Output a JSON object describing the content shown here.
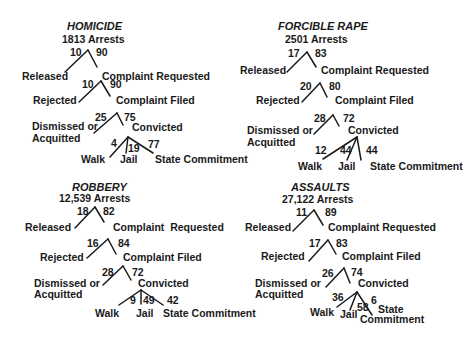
{
  "diagrams": [
    {
      "title": "HOMICIDE",
      "arrests": "1813 Arrests",
      "stage1": {
        "left_pct": "10",
        "right_pct": "90",
        "left_label": "Released",
        "right_label": "Complaint Requested"
      },
      "stage2": {
        "left_pct": "10",
        "right_pct": "90",
        "left_label": "Rejected",
        "right_label": "Complaint Filed"
      },
      "stage3": {
        "left_pct": "25",
        "right_pct": "75",
        "left_label_1": "Dismissed or",
        "left_label_2": "Acquitted",
        "right_label": "Convicted"
      },
      "outcomes": {
        "walk_pct": "4",
        "jail_pct": "19",
        "state_pct": "77",
        "walk_label": "Walk",
        "jail_label": "Jail",
        "state_label_1": "State Commitment",
        "state_label_2": ""
      }
    },
    {
      "title": "FORCIBLE RAPE",
      "arrests": "2501 Arrests",
      "stage1": {
        "left_pct": "17",
        "right_pct": "83",
        "left_label": "Released",
        "right_label": "Complaint Requested"
      },
      "stage2": {
        "left_pct": "20",
        "right_pct": "80",
        "left_label": "Rejected",
        "right_label": "Complaint Filed"
      },
      "stage3": {
        "left_pct": "28",
        "right_pct": "72",
        "left_label_1": "Dismissed or",
        "left_label_2": "Acquitted",
        "right_label": "Convicted"
      },
      "outcomes": {
        "walk_pct": "12",
        "jail_pct": "44",
        "state_pct": "44",
        "walk_label": "Walk",
        "jail_label": "Jail",
        "state_label_1": "State Commitment",
        "state_label_2": ""
      }
    },
    {
      "title": "ROBBERY",
      "arrests": "12,539 Arrests",
      "stage1": {
        "left_pct": "18",
        "right_pct": "82",
        "left_label": "Released",
        "right_label": "Complaint  Requested"
      },
      "stage2": {
        "left_pct": "16",
        "right_pct": "84",
        "left_label": "Rejected",
        "right_label": "Complaint Filed"
      },
      "stage3": {
        "left_pct": "28",
        "right_pct": "72",
        "left_label_1": "Dismissed or",
        "left_label_2": "Acquitted",
        "right_label": "Convicted"
      },
      "outcomes": {
        "walk_pct": "9",
        "jail_pct": "49",
        "state_pct": "42",
        "walk_label": "Walk",
        "jail_label": "Jail",
        "state_label_1": "State Commitment",
        "state_label_2": ""
      }
    },
    {
      "title": "ASSAULTS",
      "arrests": "27,122 Arrests",
      "stage1": {
        "left_pct": "11",
        "right_pct": "89",
        "left_label": "Released",
        "right_label": "Complaint Requested"
      },
      "stage2": {
        "left_pct": "17",
        "right_pct": "83",
        "left_label": "Rejected",
        "right_label": "Complaint Filed"
      },
      "stage3": {
        "left_pct": "26",
        "right_pct": "74",
        "left_label_1": "Dismissed or",
        "left_label_2": "Acquitted",
        "right_label": "Convicted"
      },
      "outcomes": {
        "walk_pct": "36",
        "jail_pct": "58",
        "state_pct": "6",
        "walk_label": "Walk",
        "jail_label": "Jail",
        "state_label_1": "State",
        "state_label_2": "Commitment"
      }
    }
  ]
}
